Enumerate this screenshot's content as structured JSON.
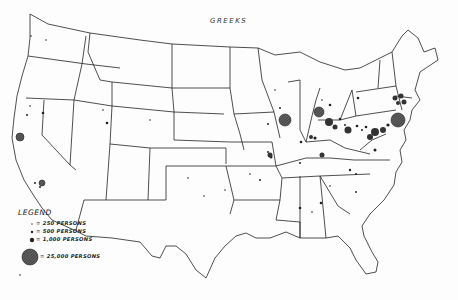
{
  "title": "GREEKS",
  "legend": {
    "heading": "LEGEND",
    "items": [
      {
        "label": "= 250 PERSONS",
        "symbol": "tiny-dot"
      },
      {
        "label": "= 500 PERSONS",
        "symbol": "small-dot"
      },
      {
        "label": "= 1,000 PERSONS",
        "symbol": "medium-dot"
      },
      {
        "label": "= 25,000 PERSONS",
        "symbol": "large-hatched-circle"
      }
    ]
  },
  "map": {
    "subject": "Distribution of Greek population in the United States",
    "large_clusters": [
      "Chicago",
      "Detroit",
      "New York",
      "Boston",
      "San Francisco",
      "Los Angeles",
      "Philadelphia",
      "Pittsburgh",
      "Cleveland"
    ]
  },
  "colors": {
    "ink": "#222222",
    "paper": "#fdfdfd"
  }
}
